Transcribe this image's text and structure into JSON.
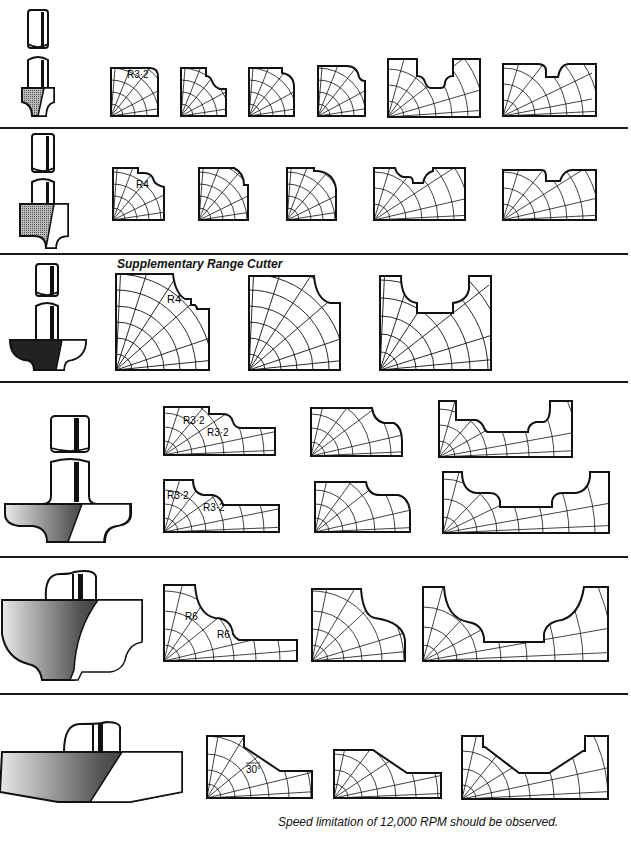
{
  "page": {
    "section_title": "Supplementary Range Cutter",
    "footer_note": "Speed limitation of 12,000 RPM should be observed.",
    "colors": {
      "ink": "#111111",
      "background": "#ffffff"
    }
  },
  "rows": [
    {
      "id": "row-1",
      "cutter_icon": "router-cutter-ogee-small",
      "profiles": [
        {
          "label": "R3·2"
        },
        {
          "label": ""
        },
        {
          "label": ""
        },
        {
          "label": ""
        },
        {
          "label": ""
        },
        {
          "label": ""
        }
      ]
    },
    {
      "id": "row-2",
      "cutter_icon": "router-cutter-ogee-medium",
      "profiles": [
        {
          "label": "R4"
        },
        {
          "label": ""
        },
        {
          "label": ""
        },
        {
          "label": ""
        },
        {
          "label": ""
        }
      ]
    },
    {
      "id": "row-3",
      "cutter_icon": "router-cutter-supplementary",
      "title": "Supplementary Range Cutter",
      "profiles": [
        {
          "label": "R4"
        },
        {
          "label": ""
        },
        {
          "label": ""
        }
      ]
    },
    {
      "id": "row-4",
      "cutter_icon": "router-cutter-double-bead",
      "profiles": [
        {
          "label_a": "R3·2",
          "label_b": "R3·2"
        },
        {
          "label": ""
        },
        {
          "label": ""
        },
        {
          "label_a": "R3·2",
          "label_b": "R3·2"
        },
        {
          "label": ""
        },
        {
          "label": ""
        }
      ]
    },
    {
      "id": "row-5",
      "cutter_icon": "router-cutter-large-ogee",
      "profiles": [
        {
          "label_a": "R6",
          "label_b": "R6"
        },
        {
          "label": ""
        },
        {
          "label": ""
        }
      ]
    },
    {
      "id": "row-6",
      "cutter_icon": "router-cutter-chamfer",
      "profiles": [
        {
          "label": "30°"
        },
        {
          "label": ""
        },
        {
          "label": ""
        }
      ]
    }
  ]
}
